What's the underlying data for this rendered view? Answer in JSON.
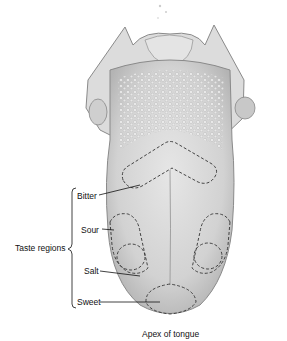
{
  "diagram": {
    "group_label": "Taste regions",
    "regions": [
      {
        "id": "bitter",
        "label": "Bitter"
      },
      {
        "id": "sour",
        "label": "Sour"
      },
      {
        "id": "salt",
        "label": "Salt"
      },
      {
        "id": "sweet",
        "label": "Sweet"
      }
    ],
    "caption": "Apex of tongue",
    "colors": {
      "tongue_fill": "#d9d9d9",
      "tongue_shade": "#b8b8b8",
      "outline": "#7a7a7a",
      "dash": "#444444",
      "text": "#111111"
    }
  }
}
